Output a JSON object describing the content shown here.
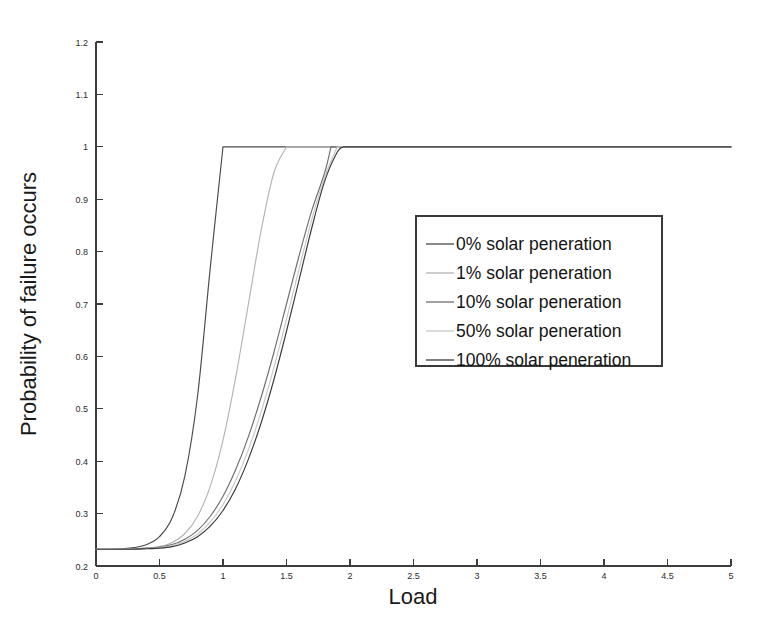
{
  "figure": {
    "background_color": "#ffffff",
    "axis_color": "#3d3d3d"
  },
  "chart_data": {
    "type": "line",
    "title": "",
    "subtitle": "",
    "xlabel": "Load",
    "ylabel": "Probability of failure occurs",
    "xlim": [
      0,
      5
    ],
    "ylim": [
      0.2,
      1.2
    ],
    "grid": false,
    "legend_position": "center-right",
    "xticks": [
      0,
      0.5,
      1,
      1.5,
      2,
      2.5,
      3,
      3.5,
      4,
      4.5,
      5
    ],
    "xticklabels": [
      "0",
      "0.5",
      "1",
      "1.5",
      "2",
      "2.5",
      "3",
      "3.5",
      "4",
      "4.5",
      "5"
    ],
    "yticks": [
      0.2,
      0.3,
      0.4,
      0.5,
      0.6,
      0.7,
      0.8,
      0.9,
      1.0,
      1.1,
      1.2
    ],
    "yticklabels": [
      "0.2",
      "0.3",
      "0.4",
      "0.5",
      "0.6",
      "0.7",
      "0.8",
      "0.9",
      "1",
      "1.1",
      "1.2"
    ],
    "baseline_value": 0.232,
    "saturation_value": 1.0,
    "x": [
      0,
      0.1,
      0.2,
      0.3,
      0.4,
      0.5,
      0.6,
      0.7,
      0.8,
      0.9,
      1.0,
      1.1,
      1.2,
      1.3,
      1.4,
      1.5,
      1.6,
      1.7,
      1.8,
      1.9,
      2.0,
      2.5,
      3.0,
      3.5,
      4.0,
      4.5,
      5.0
    ],
    "series": [
      {
        "name": "0% solar peneration",
        "color": "#4a4a4a",
        "saturation_x": 1.0,
        "values": [
          0.232,
          0.232,
          0.233,
          0.235,
          0.241,
          0.256,
          0.292,
          0.372,
          0.525,
          0.77,
          1.0,
          1.0,
          1.0,
          1.0,
          1.0,
          1.0,
          1.0,
          1.0,
          1.0,
          1.0,
          1.0,
          1.0,
          1.0,
          1.0,
          1.0,
          1.0,
          1.0
        ]
      },
      {
        "name": "1% solar peneration",
        "color": "#b4b4b4",
        "saturation_x": 1.5,
        "values": [
          0.232,
          0.232,
          0.232,
          0.233,
          0.234,
          0.237,
          0.245,
          0.262,
          0.295,
          0.352,
          0.44,
          0.56,
          0.7,
          0.84,
          0.95,
          1.0,
          1.0,
          1.0,
          1.0,
          1.0,
          1.0,
          1.0,
          1.0,
          1.0,
          1.0,
          1.0,
          1.0
        ]
      },
      {
        "name": "10% solar peneration",
        "color": "#6e6e6e",
        "saturation_x": 1.85,
        "values": [
          0.232,
          0.232,
          0.232,
          0.233,
          0.234,
          0.236,
          0.241,
          0.251,
          0.268,
          0.295,
          0.333,
          0.384,
          0.447,
          0.522,
          0.607,
          0.7,
          0.793,
          0.879,
          0.95,
          1.0,
          1.0,
          1.0,
          1.0,
          1.0,
          1.0,
          1.0,
          1.0
        ]
      },
      {
        "name": "50% solar peneration",
        "color": "#c8c8c8",
        "saturation_x": 1.9,
        "values": [
          0.232,
          0.232,
          0.232,
          0.232,
          0.233,
          0.235,
          0.239,
          0.247,
          0.261,
          0.284,
          0.317,
          0.363,
          0.422,
          0.494,
          0.578,
          0.671,
          0.768,
          0.862,
          0.942,
          1.0,
          1.0,
          1.0,
          1.0,
          1.0,
          1.0,
          1.0,
          1.0
        ]
      },
      {
        "name": "100% solar peneration",
        "color": "#3a3a3a",
        "saturation_x": 1.95,
        "values": [
          0.232,
          0.232,
          0.232,
          0.232,
          0.233,
          0.234,
          0.237,
          0.244,
          0.256,
          0.276,
          0.306,
          0.348,
          0.404,
          0.473,
          0.555,
          0.648,
          0.747,
          0.846,
          0.934,
          0.99,
          1.0,
          1.0,
          1.0,
          1.0,
          1.0,
          1.0,
          1.0
        ]
      }
    ]
  },
  "legend": {
    "items": [
      {
        "label": "0% solar peneration",
        "color": "#4a4a4a"
      },
      {
        "label": "1% solar peneration",
        "color": "#b4b4b4"
      },
      {
        "label": "10% solar peneration",
        "color": "#6e6e6e"
      },
      {
        "label": "50% solar peneration",
        "color": "#c8c8c8"
      },
      {
        "label": "100% solar peneration",
        "color": "#3a3a3a"
      }
    ]
  }
}
